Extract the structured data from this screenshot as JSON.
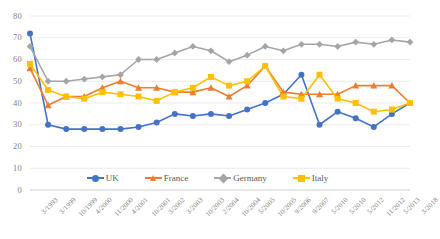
{
  "chart_data": {
    "type": "line",
    "title": "",
    "xlabel": "",
    "ylabel": "",
    "ylim": [
      0,
      80
    ],
    "ytick_step": 10,
    "yticks": [
      0,
      10,
      20,
      30,
      40,
      50,
      60,
      70,
      80
    ],
    "grid": true,
    "legend_position": "bottom",
    "categories": [
      "3/1993",
      "3/1999",
      "10/1999",
      "4/2000",
      "11/2000",
      "4/2001",
      "10/2001",
      "3/2002",
      "3/2003",
      "10/2003",
      "2/2004",
      "10/2004",
      "5/2005",
      "10/2005",
      "9/2006",
      "9/2007",
      "5/2010",
      "5/2010",
      "5/2012",
      "11/2012",
      "5/2013",
      "3/2018"
    ],
    "x_tick_labels": [
      "3/1993",
      "3/1999",
      "10/1999",
      "4/2000",
      "11/2000",
      "4/2001",
      "10/2001",
      "3/2002",
      "3/2003",
      "10/2003",
      "2/2004",
      "10/2004",
      "5/2005",
      "10/2005",
      "9/2006",
      "9/2007",
      "5/2010",
      "5/2010",
      "5/2012",
      "11/2012",
      "5/2013",
      "3/2018"
    ],
    "series": [
      {
        "name": "UK",
        "color": "#4472C4",
        "marker": "circle",
        "values": [
          72,
          30,
          28,
          28,
          28,
          28,
          29,
          31,
          35,
          34,
          35,
          34,
          37,
          40,
          44,
          53,
          30,
          36,
          33,
          29,
          35,
          40
        ]
      },
      {
        "name": "France",
        "color": "#ED7D31",
        "marker": "triangle",
        "values": [
          56,
          39,
          43,
          43,
          47,
          50,
          47,
          47,
          45,
          45,
          47,
          43,
          48,
          57,
          45,
          44,
          44,
          44,
          48,
          48,
          48,
          40
        ]
      },
      {
        "name": "Germany",
        "color": "#A5A5A5",
        "marker": "diamond",
        "values": [
          66,
          50,
          50,
          51,
          52,
          53,
          60,
          60,
          63,
          66,
          64,
          59,
          62,
          66,
          64,
          67,
          67,
          66,
          68,
          67,
          69,
          68
        ]
      },
      {
        "name": "Italy",
        "color": "#FFC000",
        "marker": "square",
        "values": [
          58,
          46,
          43,
          42,
          45,
          44,
          43,
          41,
          45,
          47,
          52,
          48,
          50,
          57,
          43,
          42,
          53,
          42,
          40,
          36,
          37,
          40
        ]
      }
    ]
  },
  "legend": {
    "items": [
      {
        "label": "UK"
      },
      {
        "label": "France"
      },
      {
        "label": "Germany"
      },
      {
        "label": "Italy"
      }
    ]
  }
}
